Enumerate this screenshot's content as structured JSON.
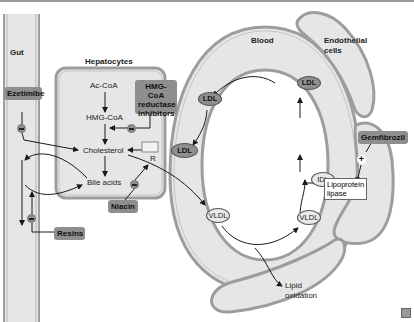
{
  "regions": {
    "gut": "Gut",
    "hepatocytes": "Hepatocytes",
    "blood": "Blood",
    "endothelial_cells_line1": "Endothelial",
    "endothelial_cells_line2": "cells"
  },
  "metabolites": {
    "ac_coa": "Ac-CoA",
    "hmg_coa": "HMG-CoA",
    "cholesterol": "Cholesterol",
    "bile_acids": "Bile acids",
    "receptor": "R",
    "lipid_oxidation_line1": "Lipid",
    "lipid_oxidation_line2": "oxidation"
  },
  "lipoproteins": {
    "ldl_top_left": "LDL",
    "ldl_top_right": "LDL",
    "ldl_receptor": "LDL",
    "idl": "IDL",
    "vldl_left": "VLDL",
    "vldl_right": "VLDL"
  },
  "enzymes": {
    "lipoprotein_lipase_line1": "Lipoprotein",
    "lipoprotein_lipase_line2": "lipase"
  },
  "drugs": {
    "ezetimibe": "Ezetimibe",
    "statins_line1": "HMG-CoA",
    "statins_line2": "reductase",
    "statins_line3": "inhibitors",
    "niacin": "Niacin",
    "resins": "Resins",
    "gemfibrozil": "Gemfibrozil"
  },
  "effects": {
    "gemfibrozil_effect": "+",
    "inhibition_symbol": "−"
  },
  "colors": {
    "membrane": "#9d9d9d",
    "compartment_fill": "#e6e6e6",
    "drug_fill": "#8e8e8e",
    "arrow": "#1a1a1a"
  }
}
